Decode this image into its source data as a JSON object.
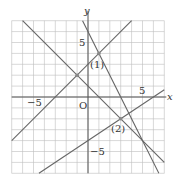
{
  "chart_data": {
    "type": "line",
    "title": "",
    "xlabel": "x",
    "ylabel": "y",
    "xlim": [
      -7,
      7
    ],
    "ylim": [
      -7,
      7
    ],
    "grid": true,
    "tick_labels": {
      "x": [
        {
          "value": -5,
          "label": "−5"
        },
        {
          "value": 5,
          "label": "5"
        }
      ],
      "y": [
        {
          "value": 5,
          "label": "5"
        },
        {
          "value": -5,
          "label": "−5"
        }
      ],
      "origin": "O"
    },
    "series": [
      {
        "name": "line-a",
        "equation": "y = x + 3",
        "slope": 1,
        "intercept": 3
      },
      {
        "name": "line-b",
        "equation": "y = -x + 1",
        "slope": -1,
        "intercept": 1
      },
      {
        "name": "line-c",
        "equation": "y = -2x + 6",
        "slope": -2,
        "intercept": 6
      },
      {
        "name": "line-d",
        "equation": "y = (2/3)x - 4",
        "slope": 0.6667,
        "intercept": -4
      }
    ],
    "points": [
      {
        "label": "(1)",
        "x": 1,
        "y": 4
      },
      {
        "label": "(2)",
        "x": 3,
        "y": -2
      },
      {
        "label": "",
        "x": -1,
        "y": 2
      }
    ]
  },
  "labels": {
    "x_axis": "x",
    "y_axis": "y",
    "origin": "O",
    "x_neg5": "−5",
    "x_pos5": "5",
    "y_pos5": "5",
    "y_neg5": "−5",
    "point1": "(1)",
    "point2": "(2)"
  },
  "colors": {
    "grid": "#bdbdbd",
    "axis": "#555555",
    "line": "#666666",
    "point": "#888888"
  }
}
